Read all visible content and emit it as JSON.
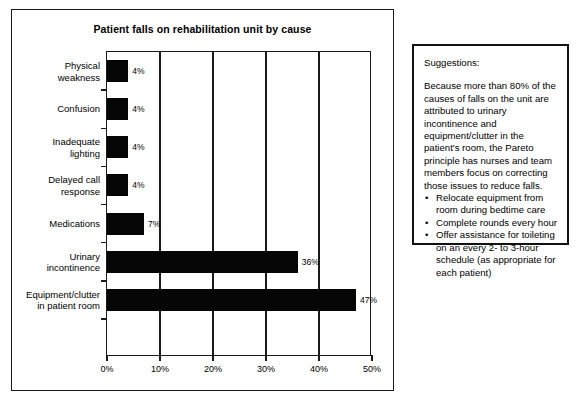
{
  "chart_panel": {
    "title": "Patient falls on rehabilitation unit by cause"
  },
  "chart_data": {
    "type": "bar",
    "orientation": "horizontal",
    "title": "Patient falls on rehabilitation unit by cause",
    "xlabel": "",
    "ylabel": "",
    "xlim": [
      0,
      50
    ],
    "xticks": [
      0,
      10,
      20,
      30,
      40,
      50
    ],
    "xtick_labels": [
      "0%",
      "10%",
      "20%",
      "30%",
      "40%",
      "50%"
    ],
    "grid": true,
    "legend": false,
    "value_suffix": "%",
    "categories": [
      "Physical weakness",
      "Confusion",
      "Inadequate lighting",
      "Delayed call response",
      "Medications",
      "Urinary incontinence",
      "Equipment/clutter in patient room"
    ],
    "category_lines": [
      [
        "Physical",
        "weakness"
      ],
      [
        "Confusion"
      ],
      [
        "Inadequate",
        "lighting"
      ],
      [
        "Delayed call",
        "response"
      ],
      [
        "Medications"
      ],
      [
        "Urinary",
        "incontinence"
      ],
      [
        "Equipment/clutter",
        "in patient room"
      ]
    ],
    "values": [
      4,
      4,
      4,
      4,
      7,
      36,
      47
    ],
    "value_labels": [
      "4%",
      "4%",
      "4%",
      "4%",
      "7%",
      "36%",
      "47%"
    ],
    "bar_color": "#050505"
  },
  "suggestions": {
    "heading": "Suggestions:",
    "body": "Because more than 80% of the causes of falls on the unit are attributed to urinary incontinence and equipment/clutter in the patient's room, the Pareto principle has nurses and team members focus on correcting those issues to reduce falls.",
    "bullet_glyph": "•",
    "items": [
      "Relocate equipment from room during bedtime care",
      "Complete rounds every hour",
      "Offer assistance for toileting on an every 2- to 3-hour schedule (as appropriate for each patient)"
    ]
  }
}
